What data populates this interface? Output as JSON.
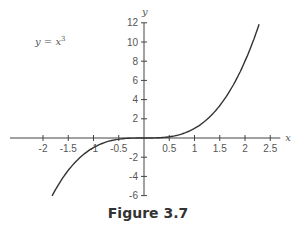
{
  "caption": "Figure 3.7",
  "chart_data": {
    "type": "line",
    "title": "",
    "annotation": "y = x³",
    "xlabel": "x",
    "ylabel": "y",
    "xlim": [
      -2.2,
      2.6
    ],
    "ylim": [
      -6,
      12
    ],
    "x_ticks": [
      -2,
      -1.5,
      -1,
      -0.5,
      0.5,
      1,
      1.5,
      2,
      2.5
    ],
    "x_tick_labels": [
      "-2",
      "-1.5",
      "-1",
      "-0.5",
      "0.5",
      "1",
      "1.5",
      "2",
      "2.5"
    ],
    "y_ticks": [
      -6,
      -4,
      -2,
      2,
      4,
      6,
      8,
      10,
      12
    ],
    "y_tick_labels": [
      "-6",
      "-4",
      "-2",
      "2",
      "4",
      "6",
      "8",
      "10",
      "12"
    ],
    "grid": false,
    "series": [
      {
        "name": "y = x^3",
        "function": "x^3",
        "x": [
          -1.82,
          -1.5,
          -1,
          -0.5,
          0,
          0.5,
          1,
          1.5,
          2,
          2.28
        ],
        "y": [
          -6.03,
          -3.375,
          -1,
          -0.125,
          0,
          0.125,
          1,
          3.375,
          8,
          11.85
        ]
      }
    ],
    "color": "#333333"
  }
}
